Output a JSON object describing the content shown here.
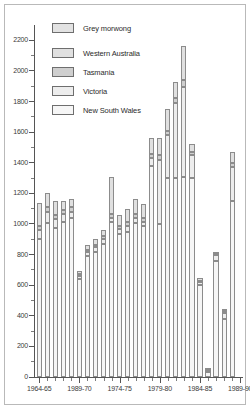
{
  "figure": {
    "width": 250,
    "height": 409,
    "background": "#ffffff",
    "frame_color": "#b9b9b9"
  },
  "legend": {
    "title": {
      "label": "Grey morwong",
      "swatch": "#e2e2e2"
    },
    "entries": [
      {
        "label": "Western Australia",
        "swatch": "#e0e0e0"
      },
      {
        "label": "Tasmania",
        "swatch": "#cfcfcf"
      },
      {
        "label": "Victoria",
        "swatch": "#ededed"
      },
      {
        "label": "New South Wales",
        "swatch": "#f6f6f6"
      }
    ]
  },
  "axes": {
    "y": {
      "ticks": [
        0,
        200,
        400,
        600,
        800,
        1000,
        1200,
        1400,
        1600,
        1800,
        2000,
        2200
      ],
      "minor_step": 100,
      "min": 0,
      "max": 2300,
      "label": ""
    },
    "x": {
      "labels": [
        "1964-65",
        "1989-70",
        "1974-75",
        "1979-80",
        "1984-85",
        "1989-90"
      ],
      "label_indices": [
        0,
        5,
        10,
        15,
        20,
        25
      ],
      "label": ""
    }
  },
  "chart_data": {
    "type": "bar",
    "stacked": true,
    "title": "Grey morwong",
    "xlabel": "",
    "ylabel": "",
    "ylim": [
      0,
      2300
    ],
    "grid": false,
    "legend_position": "top-left",
    "categories": [
      "1964-65",
      "1965-66",
      "1966-67",
      "1967-68",
      "1968-69",
      "1989-70",
      "1970-71",
      "1971-72",
      "1972-73",
      "1973-74",
      "1974-75",
      "1975-76",
      "1976-77",
      "1977-78",
      "1978-79",
      "1979-80",
      "1980-81",
      "1981-82",
      "1982-83",
      "1983-84",
      "1984-85",
      "1985-86",
      "1986-87",
      "1987-88",
      "1988-89",
      "1989-90"
    ],
    "series": [
      {
        "name": "New South Wales",
        "color": "#f6f6f6",
        "values": [
          900,
          1005,
          975,
          1010,
          1040,
          640,
          790,
          820,
          870,
          1010,
          935,
          945,
          1005,
          985,
          1380,
          1000,
          1300,
          1300,
          1305,
          1300,
          600,
          30,
          760,
          380,
          1150,
          0
        ]
      },
      {
        "name": "Victoria",
        "color": "#ededed",
        "values": [
          60,
          75,
          60,
          55,
          40,
          20,
          25,
          30,
          30,
          30,
          30,
          40,
          35,
          30,
          50,
          420,
          280,
          490,
          590,
          150,
          20,
          10,
          40,
          40,
          220,
          0
        ]
      },
      {
        "name": "Tasmania",
        "color": "#cfcfcf",
        "values": [
          25,
          30,
          25,
          25,
          30,
          10,
          15,
          15,
          20,
          25,
          20,
          25,
          25,
          25,
          25,
          30,
          30,
          30,
          45,
          20,
          10,
          5,
          5,
          10,
          30,
          0
        ]
      },
      {
        "name": "Western Australia",
        "color": "#e0e0e0",
        "values": [
          155,
          90,
          90,
          60,
          55,
          20,
          30,
          40,
          40,
          240,
          75,
          85,
          100,
          90,
          105,
          110,
          140,
          105,
          220,
          55,
          20,
          5,
          5,
          15,
          70,
          0
        ]
      }
    ]
  }
}
